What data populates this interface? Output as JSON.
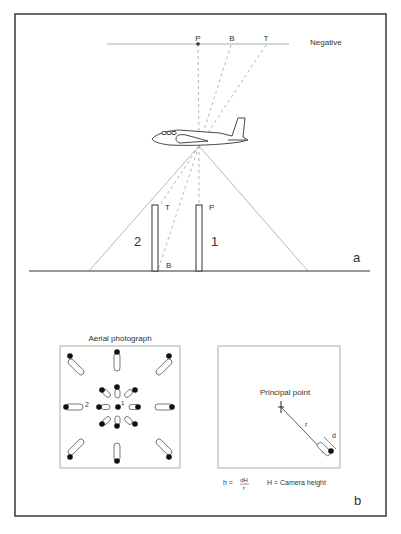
{
  "panel_a": {
    "negative_label": "Negative",
    "negative_points": {
      "p": "P",
      "b": "B",
      "t": "T"
    },
    "tower_left_number": "2",
    "tower_right_number": "1",
    "tower_left_top_label": "T",
    "tower_left_base_label": "B",
    "tower_right_top_label": "P",
    "panel_letter": "a"
  },
  "panel_b": {
    "aerial_title": "Aerial photograph",
    "center_label": "1",
    "left_label": "2",
    "principal_point_label": "Principal point",
    "r_label": "r",
    "d_label": "d",
    "formula_lhs": "h =",
    "formula_num": "dH",
    "formula_den": "r",
    "camera_height_note": "H = Camera height",
    "panel_letter": "b"
  },
  "colors": {
    "frame": "#444444",
    "line": "#888888",
    "dash": "#999999",
    "ink": "#222222"
  }
}
